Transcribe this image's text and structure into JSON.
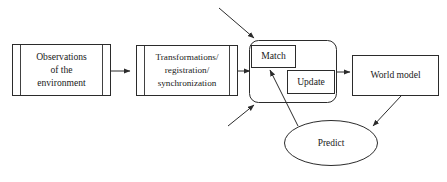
{
  "diagram": {
    "background_color": "#ffffff",
    "stroke_color": "#2b2b2b",
    "text_color": "#1a1a1a",
    "nodes": {
      "observations": {
        "label_line1": "Observations",
        "label_line2": "of the",
        "label_line3": "environment",
        "shape": "predefined-process"
      },
      "transformations": {
        "label_line1": "Transformations/",
        "label_line2": "registration/",
        "label_line3": "synchronization",
        "shape": "predefined-process"
      },
      "match": {
        "label": "Match",
        "shape": "rectangle"
      },
      "update": {
        "label": "Update",
        "shape": "rectangle"
      },
      "world_model": {
        "label": "World model",
        "shape": "rectangle"
      },
      "predict": {
        "label": "Predict",
        "shape": "ellipse"
      },
      "group": {
        "label": "",
        "shape": "rounded-rectangle"
      }
    },
    "connectors": [
      {
        "name": "observations-to-transformations",
        "from": "observations",
        "to": "transformations",
        "arrow": true
      },
      {
        "name": "transformations-to-group",
        "from": "transformations",
        "to": "group",
        "arrow": true
      },
      {
        "name": "external-input-top",
        "from": "external",
        "to": "group",
        "arrow": true
      },
      {
        "name": "external-input-bottom",
        "from": "external",
        "to": "group",
        "arrow": true
      },
      {
        "name": "group-to-world-model",
        "from": "group",
        "to": "world_model",
        "arrow": true
      },
      {
        "name": "world-model-to-predict",
        "from": "world_model",
        "to": "predict",
        "arrow": true
      },
      {
        "name": "predict-to-match",
        "from": "predict",
        "to": "match",
        "arrow": true
      }
    ]
  }
}
